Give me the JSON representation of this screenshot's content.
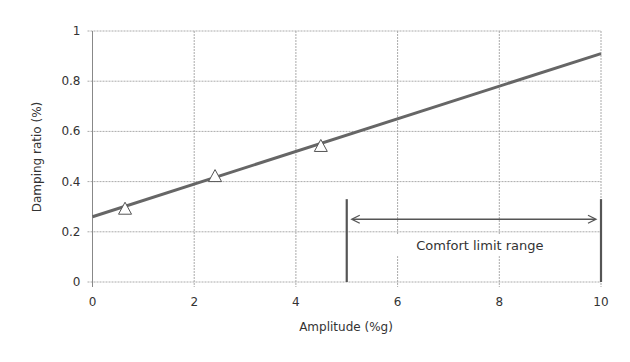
{
  "chart_data": {
    "type": "line",
    "title": "",
    "xlabel": "Amplitude (%g)",
    "ylabel": "Damping ratio (%)",
    "xlim": [
      0,
      10
    ],
    "ylim": [
      0,
      1
    ],
    "xticks": [
      0,
      2,
      4,
      6,
      8,
      10
    ],
    "xtick_labels": [
      "0",
      "2",
      "4",
      "6",
      "8",
      "10"
    ],
    "yticks": [
      0,
      0.2,
      0.4,
      0.6,
      0.8,
      1
    ],
    "ytick_labels": [
      "0",
      "0.2",
      "0.4",
      "0.6",
      "0.8",
      "1"
    ],
    "grid": true,
    "legend": null,
    "series": [
      {
        "name": "Measured",
        "kind": "scatter",
        "marker": "open-triangle",
        "x": [
          0.64,
          2.41,
          4.49
        ],
        "y": [
          0.29,
          0.42,
          0.54
        ]
      },
      {
        "name": "Linear fit",
        "kind": "line",
        "x": [
          0,
          10
        ],
        "y": [
          0.26,
          0.91
        ]
      }
    ],
    "annotations": [
      {
        "type": "range",
        "label": "Comfort limit range",
        "x_start": 5,
        "x_end": 10,
        "y_bar_top": 0.33,
        "y_arrow": 0.25,
        "y_text": 0.135
      }
    ]
  },
  "colors": {
    "axis": "#888888",
    "grid": "#aaaaaa",
    "line": "#666666",
    "marker_stroke": "#555555",
    "annotation": "#555555",
    "text": "#333333"
  }
}
